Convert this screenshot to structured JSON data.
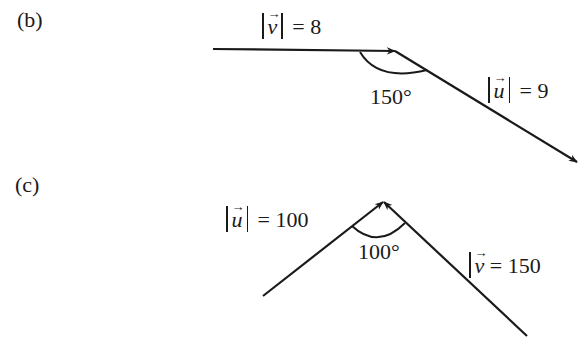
{
  "diagrams": [
    {
      "id": "b",
      "part_label": "(b)",
      "vectors": [
        {
          "name": "v",
          "magnitude_label": "= 8",
          "symbol": "v"
        },
        {
          "name": "u",
          "magnitude_label": "= 9",
          "symbol": "u"
        }
      ],
      "angle_label": "150°"
    },
    {
      "id": "c",
      "part_label": "(c)",
      "vectors": [
        {
          "name": "u",
          "magnitude_label": "= 100",
          "symbol": "u"
        },
        {
          "name": "v",
          "magnitude_label": "= 150",
          "symbol": "v"
        }
      ],
      "angle_label": "100°"
    }
  ],
  "arrow_glyph": "→",
  "colors": {
    "stroke": "#1a1a1a",
    "background": "#ffffff"
  }
}
